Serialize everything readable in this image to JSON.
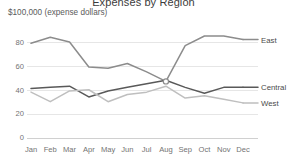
{
  "chart_data": {
    "type": "line",
    "title": "Expenses by Region",
    "subtitle": "$100,000 (expense dollars)",
    "xlabel": "",
    "ylabel": "",
    "categories": [
      "Jan",
      "Feb",
      "Mar",
      "Apr",
      "May",
      "Jun",
      "Jul",
      "Aug",
      "Sep",
      "Oct",
      "Nov",
      "Dec"
    ],
    "yticks": [
      0,
      20,
      40,
      60,
      80
    ],
    "ylim": [
      0,
      90
    ],
    "grid": true,
    "legend_position": "inline-right",
    "series": [
      {
        "name": "East",
        "color": "#8c8c8c",
        "values": [
          79,
          84,
          80,
          59,
          58,
          62,
          55,
          47,
          77,
          85,
          85,
          82
        ]
      },
      {
        "name": "Central",
        "color": "#595959",
        "values": [
          41,
          42,
          43,
          34,
          39,
          42,
          45,
          48,
          42,
          37,
          42,
          42
        ]
      },
      {
        "name": "West",
        "color": "#bfbfbf",
        "values": [
          38,
          30,
          39,
          40,
          30,
          36,
          38,
          43,
          33,
          35,
          32,
          29
        ]
      }
    ],
    "markers": [
      {
        "series": "East",
        "category": "Aug",
        "value": 47
      }
    ]
  },
  "axis": {
    "y_labels": [
      "80",
      "60",
      "40",
      "20",
      "0"
    ],
    "x_labels": [
      "Jan",
      "Feb",
      "Mar",
      "Apr",
      "May",
      "Jun",
      "Jul",
      "Aug",
      "Sep",
      "Oct",
      "Nov",
      "Dec"
    ]
  },
  "labels": {
    "east": "East",
    "central": "Central",
    "west": "West"
  }
}
